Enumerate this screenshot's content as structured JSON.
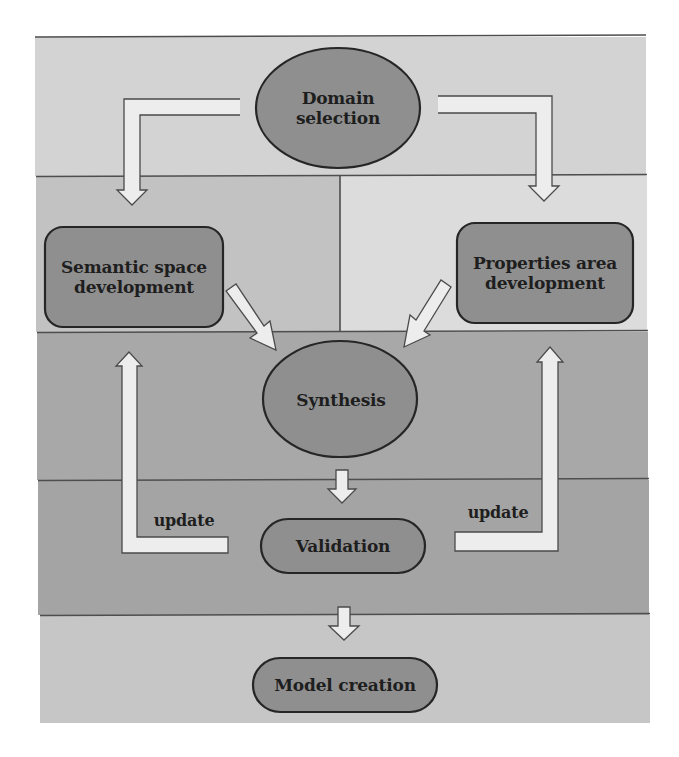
{
  "diagram": {
    "colors": {
      "page_background": "#ffffff",
      "band_top": "#d3d3d3",
      "band_left_panel": "#c2c2c2",
      "band_right_panel": "#dcdcdc",
      "band_synthesis": "#a8a8a8",
      "band_validation": "#a4a4a4",
      "band_bottom": "#c6c6c6",
      "node_fill": "#8f8f8f",
      "node_stroke": "#262626",
      "arrow_fill": "#ededed",
      "arrow_stroke": "#4a4a4a",
      "divider": "#4e4e4e",
      "text": "#1e1e1e"
    },
    "nodes": {
      "domain_selection": {
        "label_line1": "Domain",
        "label_line2": "selection",
        "shape": "ellipse"
      },
      "semantic_space": {
        "label_line1": "Semantic space",
        "label_line2": "development",
        "shape": "rounded-rect"
      },
      "properties_area": {
        "label_line1": "Properties area",
        "label_line2": "development",
        "shape": "rounded-rect"
      },
      "synthesis": {
        "label": "Synthesis",
        "shape": "ellipse"
      },
      "validation": {
        "label": "Validation",
        "shape": "pill"
      },
      "model_creation": {
        "label": "Model creation",
        "shape": "pill"
      }
    },
    "edges": [
      {
        "from": "domain_selection",
        "to": "semantic_space",
        "style": "elbow-arrow"
      },
      {
        "from": "domain_selection",
        "to": "properties_area",
        "style": "elbow-arrow"
      },
      {
        "from": "semantic_space",
        "to": "synthesis",
        "style": "diagonal-arrow"
      },
      {
        "from": "properties_area",
        "to": "synthesis",
        "style": "diagonal-arrow"
      },
      {
        "from": "synthesis",
        "to": "validation",
        "style": "down-arrow"
      },
      {
        "from": "validation",
        "to": "semantic_space",
        "style": "elbow-arrow",
        "label": "update"
      },
      {
        "from": "validation",
        "to": "properties_area",
        "style": "elbow-arrow",
        "label": "update"
      },
      {
        "from": "validation",
        "to": "model_creation",
        "style": "down-arrow"
      }
    ],
    "edge_labels": {
      "left_update": "update",
      "right_update": "update"
    }
  }
}
